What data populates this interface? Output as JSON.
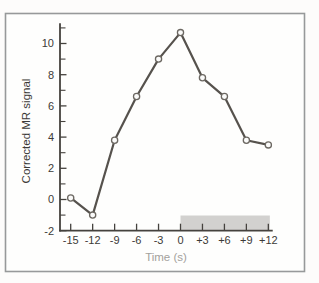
{
  "figure": {
    "frame_color": "#97999a",
    "background_color": "#fdfcfb"
  },
  "chart_data": {
    "type": "line",
    "title": "",
    "xlabel": "Time (s)",
    "ylabel": "Corrected MR signal",
    "x": [
      -15,
      -12,
      -9,
      -6,
      -3,
      0,
      3,
      6,
      9,
      12
    ],
    "x_tick_labels": [
      "-15",
      "-12",
      "-9",
      "-6",
      "-3",
      "0",
      "+3",
      "+6",
      "+9",
      "+12"
    ],
    "values": [
      0.1,
      -1.0,
      3.8,
      6.6,
      9.0,
      10.7,
      7.8,
      6.6,
      3.8,
      3.5
    ],
    "y_ticks": [
      -2,
      0,
      2,
      4,
      6,
      8,
      10
    ],
    "y_tick_labels": [
      "-2",
      "0",
      "2",
      "4",
      "6",
      "8",
      "10"
    ],
    "y_minor_ticks": [
      -1,
      1,
      3,
      5,
      7,
      9,
      11
    ],
    "xlim": [
      -16.4,
      12.6
    ],
    "ylim": [
      -2,
      11.3
    ],
    "grid": false,
    "legend": "none",
    "marker": "open-circle",
    "line_color": "#56524d",
    "marker_fill": "#fbfbfa",
    "marker_stroke": "#6c6862",
    "axis_color": "#45423e",
    "shaded_region": {
      "x_start": 0,
      "x_end": 12,
      "color": "#d2d1cf"
    }
  }
}
